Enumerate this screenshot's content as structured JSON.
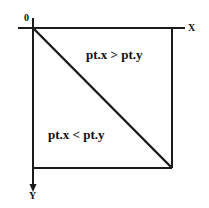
{
  "diagram": {
    "origin_label": "0",
    "x_axis_label": "X",
    "y_axis_label": "Y",
    "upper_region_label": "pt.x > pt.y",
    "lower_region_label": "pt.x < pt.y",
    "stroke_color": "#1a1a1a",
    "background_color": "#ffffff",
    "geometry": {
      "origin": [
        33,
        28
      ],
      "square_bottom_right": [
        172,
        168
      ],
      "x_axis_start": [
        18,
        28
      ],
      "x_axis_end": [
        185,
        28
      ],
      "y_axis_start": [
        33,
        18
      ],
      "y_axis_end": [
        33,
        190
      ]
    }
  }
}
